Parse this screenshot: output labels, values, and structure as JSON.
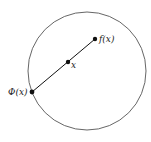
{
  "diagram": {
    "type": "retraction-illustration",
    "circle": {
      "cx": 87,
      "cy": 71,
      "r": 59,
      "stroke": "#555555"
    },
    "segment": {
      "from": "f_x",
      "to": "phi_x",
      "stroke": "#111111"
    },
    "points": {
      "f_x": {
        "label": "f(x)",
        "x": 95,
        "y": 39
      },
      "x": {
        "label": "x",
        "x": 68,
        "y": 62
      },
      "phi_x": {
        "label": "Φ(x)",
        "x": 32,
        "y": 92
      }
    },
    "colors": {
      "background": "#ffffff",
      "ink": "#111111"
    }
  }
}
